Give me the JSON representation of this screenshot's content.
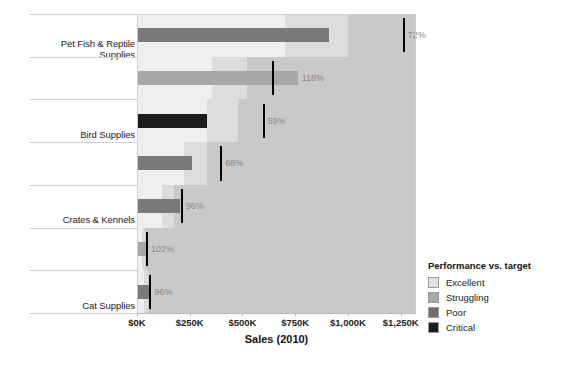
{
  "chart_data": {
    "type": "bar",
    "subtype": "bullet",
    "title": "",
    "xlabel": "Sales (2010)",
    "ylabel": "",
    "xlim": [
      0,
      1318
    ],
    "grid": false,
    "legend_position": "right-bottom",
    "categories": [
      "Pet Fish & Reptile Supplies",
      "Bird Supplies",
      "Crates & Kennels",
      "Cat Supplies",
      "Collars, Harnesses & Leashes",
      "Pet Gates & Pet Doors",
      "Pet Beds"
    ],
    "tick_labels": [
      "$0K",
      "$250K",
      "$500K",
      "$750K",
      "$1,000K",
      "$1,250K"
    ],
    "tick_values": [
      0,
      250,
      500,
      750,
      1000,
      1250
    ],
    "series": [
      {
        "name": "Sales (2010)",
        "values": [
          910,
          762,
          330,
          262,
          203,
          47,
          62
        ]
      },
      {
        "name": "Target",
        "values": [
          1265,
          645,
          600,
          400,
          212,
          46,
          64
        ]
      }
    ],
    "percent_of_target": [
      "72%",
      "118%",
      "59%",
      "68%",
      "96%",
      "102%",
      "96%"
    ],
    "performance_levels": [
      "Poor",
      "Struggling",
      "Critical",
      "Poor",
      "Poor",
      "Struggling",
      "Poor"
    ],
    "annotations": [
      "72%",
      "118%",
      "59%",
      "68%",
      "96%",
      "102%",
      "96%"
    ]
  },
  "rows": [
    {
      "label_line1": "Pet Fish & Reptile",
      "label_line2": "Supplies",
      "pct": "72%",
      "value": 910,
      "target": 1265,
      "level": "poor",
      "bands": [
        700,
        1000,
        1318
      ]
    },
    {
      "label_line1": "Bird Supplies",
      "label_line2": "",
      "pct": "118%",
      "value": 762,
      "target": 645,
      "level": "struggling",
      "bands": [
        355,
        520,
        1318
      ]
    },
    {
      "label_line1": "Crates & Kennels",
      "label_line2": "",
      "pct": "59%",
      "value": 330,
      "target": 600,
      "level": "critical",
      "bands": [
        330,
        480,
        1318
      ]
    },
    {
      "label_line1": "Cat Supplies",
      "label_line2": "",
      "pct": "68%",
      "value": 262,
      "target": 400,
      "level": "poor",
      "bands": [
        222,
        330,
        1318
      ]
    },
    {
      "label_line1": "Collars, Harnesses &",
      "label_line2": "Leashes",
      "pct": "96%",
      "value": 203,
      "target": 212,
      "level": "poor",
      "bands": [
        118,
        175,
        1318
      ]
    },
    {
      "label_line1": "Pet Gates & Pet Doors",
      "label_line2": "",
      "pct": "102%",
      "value": 47,
      "target": 46,
      "level": "struggling",
      "bands": [
        26,
        38,
        1318
      ]
    },
    {
      "label_line1": "Pet Beds",
      "label_line2": "",
      "pct": "96%",
      "value": 62,
      "target": 64,
      "level": "poor",
      "bands": [
        35,
        52,
        1318
      ]
    }
  ],
  "axis": {
    "title": "Sales (2010)",
    "ticks": [
      "$0K",
      "$250K",
      "$500K",
      "$750K",
      "$1,000K",
      "$1,250K"
    ]
  },
  "legend": {
    "title": "Performance vs. target",
    "items": [
      {
        "label": "Excellent",
        "color": "#e2e2e2"
      },
      {
        "label": "Struggling",
        "color": "#a8a8a8"
      },
      {
        "label": "Poor",
        "color": "#6f6f6f"
      },
      {
        "label": "Critical",
        "color": "#1c1c1c"
      }
    ]
  }
}
